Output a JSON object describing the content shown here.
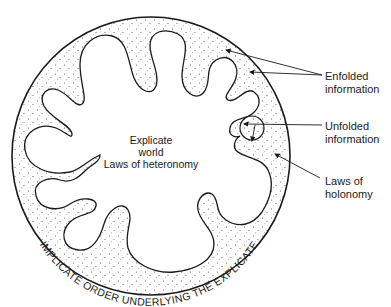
{
  "diagram": {
    "center_label": {
      "line1": "Explicate",
      "line2": "world",
      "line3": "Laws of heteronomy"
    },
    "ring_label": "IMPLICATE ORDER UNDERLYING THE EXPLICATE",
    "callouts": [
      {
        "id": "enfolded",
        "line1": "Enfolded",
        "line2": "information"
      },
      {
        "id": "unfolded",
        "line1": "Unfolded",
        "line2": "information"
      },
      {
        "id": "holonomy",
        "line1": "Laws of",
        "line2": "holonomy"
      }
    ],
    "colors": {
      "stroke": "#1a1a1a",
      "dots": "#555555",
      "background": "#ffffff"
    }
  }
}
